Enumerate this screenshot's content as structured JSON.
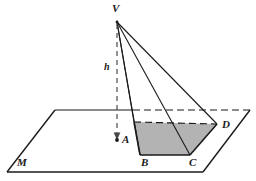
{
  "figure": {
    "type": "geometry-diagram",
    "width": 256,
    "height": 181,
    "background_color": "#ffffff",
    "stroke_color": "#1a1a1a",
    "shaded_fill_color": "#b3b3b3",
    "labels": {
      "apex": "V",
      "height": "h",
      "foot": "A",
      "base_front_left": "B",
      "base_front_right": "C",
      "base_back_right": "D",
      "plane": "M"
    },
    "points": {
      "V": {
        "x": 117,
        "y": 22
      },
      "A": {
        "x": 117,
        "y": 140
      },
      "A_prime": {
        "x": 134,
        "y": 122
      },
      "B": {
        "x": 140,
        "y": 155
      },
      "C": {
        "x": 190,
        "y": 155
      },
      "D": {
        "x": 217,
        "y": 124
      }
    },
    "plane_corners": {
      "left": {
        "x": 7,
        "y": 172
      },
      "top_left": {
        "x": 55,
        "y": 110
      },
      "top_right": {
        "x": 250,
        "y": 110
      },
      "bottom_right": {
        "x": 203,
        "y": 172
      }
    },
    "label_positions": {
      "V": {
        "x": 112,
        "y": 3
      },
      "h": {
        "x": 104,
        "y": 62
      },
      "A": {
        "x": 122,
        "y": 134
      },
      "B": {
        "x": 141,
        "y": 157
      },
      "C": {
        "x": 189,
        "y": 157
      },
      "D": {
        "x": 222,
        "y": 119
      },
      "M": {
        "x": 17,
        "y": 157
      }
    },
    "elements": {
      "plane_name": "plane-M",
      "apex_name": "apex-V",
      "height_segment_name": "height-segment-h",
      "base_quad_name": "shaded-base-quadrilateral"
    }
  }
}
